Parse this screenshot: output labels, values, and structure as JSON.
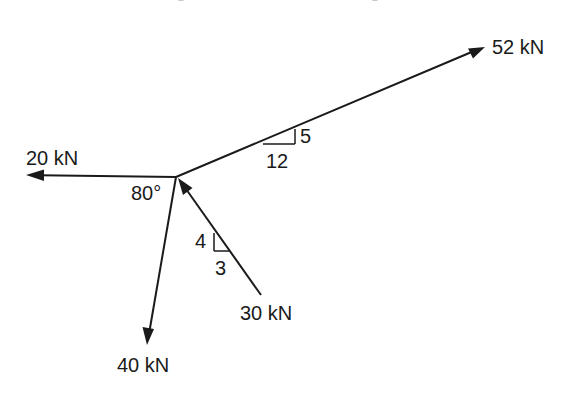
{
  "diagram": {
    "type": "force-system",
    "line_color": "#1a1a1a",
    "background": "#ffffff",
    "origin": {
      "x": 176,
      "y": 177
    },
    "forces": [
      {
        "id": "f52",
        "label": "52 kN",
        "magnitude_kN": 52,
        "direction": "outward",
        "slope": {
          "rise": 5,
          "run": 12,
          "rise_label": "5",
          "run_label": "12"
        },
        "tip": {
          "x": 485,
          "y": 47
        }
      },
      {
        "id": "f20",
        "label": "20 kN",
        "magnitude_kN": 20,
        "direction": "outward",
        "tip": {
          "x": 26,
          "y": 175
        }
      },
      {
        "id": "f40",
        "label": "40 kN",
        "magnitude_kN": 40,
        "direction": "outward",
        "angle_label": "80°",
        "angle_deg": 80,
        "tip": {
          "x": 147,
          "y": 345
        }
      },
      {
        "id": "f30",
        "label": "30 kN",
        "magnitude_kN": 30,
        "direction": "toward-origin",
        "slope": {
          "rise": 4,
          "run": 3,
          "rise_label": "4",
          "run_label": "3"
        },
        "tail": {
          "x": 261,
          "y": 295
        }
      }
    ],
    "labels": {
      "f52": "52 kN",
      "f20": "20 kN",
      "f40": "40 kN",
      "f30": "30 kN",
      "angle": "80°",
      "slope52_rise": "5",
      "slope52_run": "12",
      "slope30_rise": "4",
      "slope30_run": "3"
    }
  }
}
